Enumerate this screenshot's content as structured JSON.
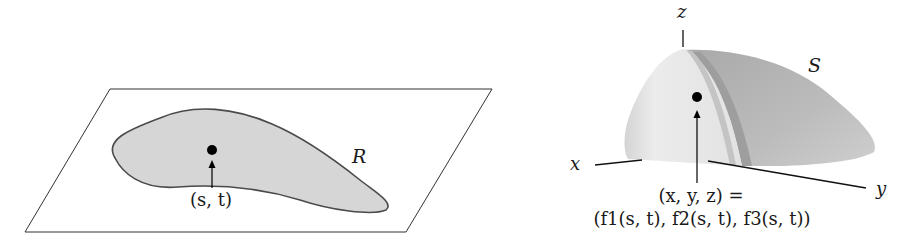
{
  "figure": {
    "left_panel": {
      "region_label": "R",
      "point_label": "(s, t)",
      "plane_color": "#ffffff",
      "region_fill": "#d9d9d9",
      "region_stroke": "#4a4a4a"
    },
    "right_panel": {
      "surface_label": "S",
      "axes": {
        "x": "x",
        "y": "y",
        "z": "z"
      },
      "point_label_line1": "(x, y, z) =",
      "point_label_line2": "(f1(s, t), f2(s, t), f3(s, t))",
      "surface_colors": [
        "#e6e6e6",
        "#c8c8c8",
        "#a8a8a8",
        "#bdbdbd"
      ]
    }
  }
}
